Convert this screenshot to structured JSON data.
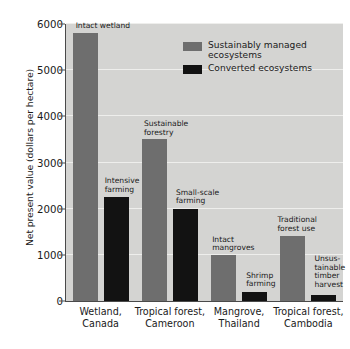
{
  "chart_data": {
    "type": "bar",
    "title": "",
    "xlabel": "",
    "ylabel": "Net present value (dollars per hectare)",
    "ylim": [
      0,
      6000
    ],
    "yticks": [
      0,
      1000,
      2000,
      3000,
      4000,
      5000,
      6000
    ],
    "ytick_labels": [
      "0",
      "1000",
      "2000",
      "3000",
      "4000",
      "5000",
      "6000"
    ],
    "grid": true,
    "legend_position": "upper right",
    "categories": [
      "Wetland,\nCanada",
      "Tropical forest,\nCameroon",
      "Mangrove,\nThailand",
      "Tropical forest,\nCambodia"
    ],
    "series": [
      {
        "name": "Sustainably managed\necosystems",
        "color": "#6e6e6e",
        "values": [
          5800,
          3500,
          1000,
          1400
        ],
        "point_labels": [
          "Intact wetland",
          "Sustainable\nforestry",
          "Intact\nmangroves",
          "Traditional\nforest use"
        ]
      },
      {
        "name": "Converted ecosystems",
        "color": "#121212",
        "values": [
          2250,
          2000,
          200,
          130
        ],
        "point_labels": [
          "Intensive\nfarming",
          "Small-scale\nfarming",
          "Shrimp\nfarming",
          "Unsus-\ntainable\ntimber\nharvest"
        ]
      }
    ]
  },
  "legend": {
    "items": [
      {
        "label": "Sustainably managed\necosystems",
        "swatch": "light"
      },
      {
        "label": "Converted ecosystems",
        "swatch": "dark"
      }
    ]
  },
  "colors": {
    "plot_background": "#d4d4d2",
    "gridline": "#eeeeec",
    "axis": "#4a4a4a",
    "sustainable": "#6e6e6e",
    "converted": "#121212",
    "text": "#1a1a1a",
    "page_background": "#ffffff"
  }
}
